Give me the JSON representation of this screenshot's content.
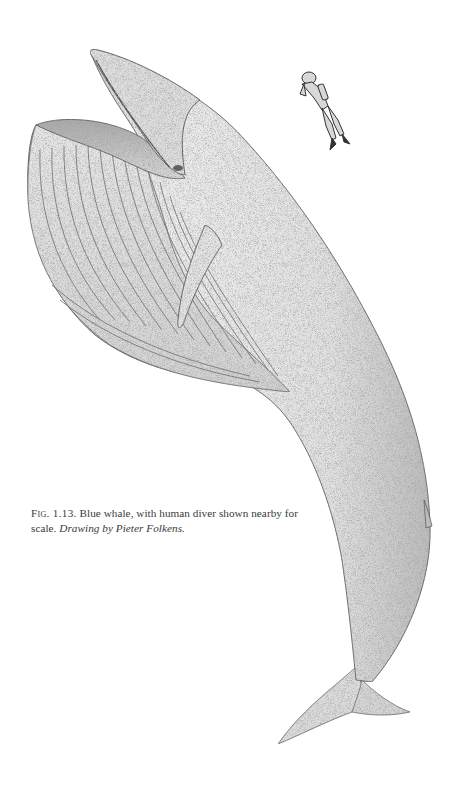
{
  "figure": {
    "label": "Fig. 1.13.",
    "caption_text": "Blue whale, with human diver shown nearby for scale.",
    "credit": "Drawing by Pieter Folkens.",
    "illustration_subjects": [
      "blue-whale",
      "human-diver"
    ],
    "style": "stippled pen-and-ink drawing"
  },
  "colors": {
    "background": "#ffffff",
    "ink": "#3a3a3a",
    "whale_fill": "#e6e6e6",
    "whale_shade": "#bdbdbd",
    "outline": "#555555"
  }
}
